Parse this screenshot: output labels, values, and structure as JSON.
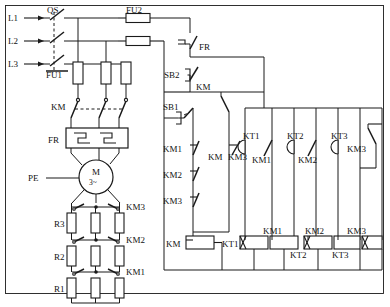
{
  "diagram": {
    "supply_lines": [
      "L1",
      "L2",
      "L3"
    ],
    "ground_label": "PE",
    "labels": {
      "qs": "QS",
      "fu1": "FU1",
      "fu2": "FU2",
      "km_main": "KM",
      "fr_relay": "FR",
      "fr_contact": "FR",
      "pe": "PE",
      "sb1": "SB1",
      "sb2": "SB2",
      "km_seal": "KM",
      "km3_branch": "KM3",
      "km_nc1": "KM1",
      "km_nc2": "KM2",
      "km_nc3": "KM3",
      "kt1_contact": "KT1",
      "kt2_contact": "KT2",
      "kt3_contact": "KT3",
      "km1_contact": "KM1",
      "km2_contact": "KM2",
      "km3_contact": "KM3",
      "km3_hold": "KM3",
      "coil_km": "KM",
      "coil_kt1": "KT1",
      "coil_km1": "KM1",
      "coil_kt2": "KT2",
      "coil_km2": "KM2",
      "coil_kt3": "KT3",
      "coil_km3": "KM3",
      "r1": "R1",
      "r2": "R2",
      "r3": "R3",
      "short_km1": "KM1",
      "short_km2": "KM2",
      "short_km3": "KM3",
      "motor_m": "M",
      "motor_phase": "3~"
    },
    "power_circuit": {
      "disconnect": "QS",
      "main_fuses": "FU1",
      "contactor": "KM",
      "overload_relay": "FR",
      "motor": {
        "symbol": "M",
        "type": "3~"
      },
      "rotor_resistors": [
        "R3",
        "R2",
        "R1"
      ],
      "shorting_contactors": [
        "KM3",
        "KM2",
        "KM1"
      ]
    },
    "control_circuit": {
      "control_fuses": "FU2",
      "protection_contact": "FR",
      "stop_button": "SB2",
      "start_button": "SB1",
      "seal_in_contact": "KM",
      "interlock_contacts": [
        "KM1",
        "KM2",
        "KM3"
      ],
      "timer_contacts": [
        "KT1",
        "KT2",
        "KT3"
      ],
      "auxiliary_contacts": [
        "KM1",
        "KM2",
        "KM3"
      ],
      "holding_contact": "KM3",
      "coils": [
        "KM",
        "KT1",
        "KM1",
        "KT2",
        "KM2",
        "KT3",
        "KM3"
      ]
    },
    "colors": {
      "line": "#1a1a1a",
      "background": "#ffffff"
    }
  }
}
